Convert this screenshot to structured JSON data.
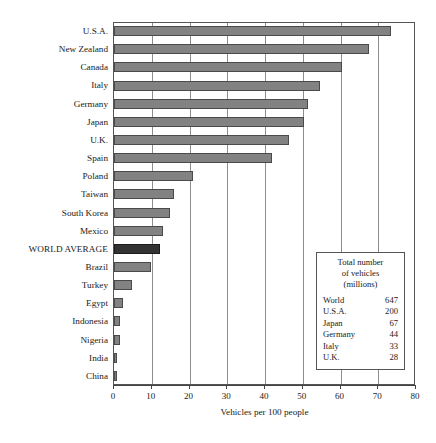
{
  "chart_data": {
    "type": "bar",
    "orientation": "horizontal",
    "title": "",
    "xlabel": "Vehicles per 100 people",
    "ylabel": "",
    "xlim": [
      0,
      80
    ],
    "xticks": [
      0,
      10,
      20,
      30,
      40,
      50,
      60,
      70,
      80
    ],
    "grid": "vertical",
    "legend": "none",
    "categories": [
      "U.S.A.",
      "New Zealand",
      "Canada",
      "Italy",
      "Germany",
      "Japan",
      "U.K.",
      "Spain",
      "Poland",
      "Taiwan",
      "South Korea",
      "Mexico",
      "WORLD AVERAGE",
      "Brazil",
      "Turkey",
      "Egypt",
      "Indonesia",
      "Nigeria",
      "India",
      "China"
    ],
    "values": [
      73.5,
      67.5,
      60.4,
      54.7,
      51.4,
      50.3,
      46.3,
      41.9,
      20.9,
      15.9,
      14.8,
      13.0,
      12.2,
      9.7,
      4.8,
      2.4,
      1.7,
      1.6,
      0.6,
      0.6
    ],
    "highlight_category": "WORLD AVERAGE",
    "colors": {
      "bar": "#828282",
      "bar_border": "#4a4a4a",
      "highlight_bar": "#333333",
      "highlight_bar_border": "#1c1c1c",
      "gridline": "#8d8d8d",
      "frame": "#555555",
      "text": "#1a1a1a"
    }
  },
  "inset": {
    "title_lines": [
      "Total number",
      "of vehicles",
      "(millions)"
    ],
    "rows": [
      {
        "name": "World",
        "value": "647"
      },
      {
        "name": "U.S.A.",
        "value": "200"
      },
      {
        "name": "Japan",
        "value": "67"
      },
      {
        "name": "Germany",
        "value": "44"
      },
      {
        "name": "Italy",
        "value": "33"
      },
      {
        "name": "U.K.",
        "value": "28"
      }
    ]
  }
}
